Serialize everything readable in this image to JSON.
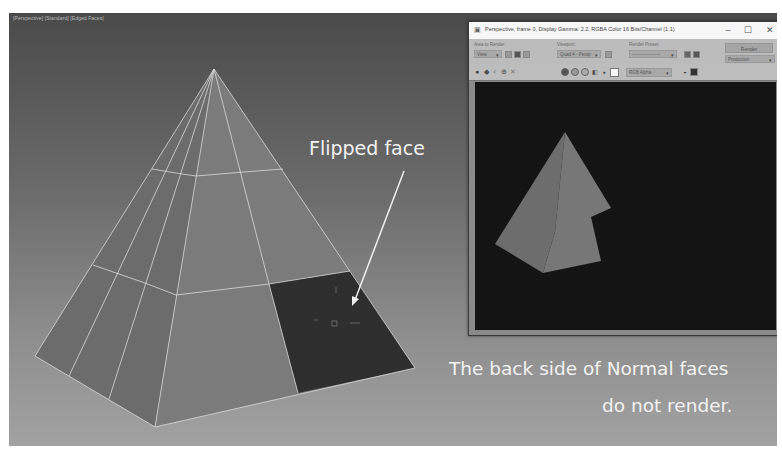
{
  "viewport": {
    "label": "[Perspective] [Standard] [Edged Faces]",
    "background_top": "#4a4a4a",
    "background_bottom": "#a2a2a2"
  },
  "scene": {
    "pyramid_face_color": "#7a7a7a",
    "pyramid_face_light": "#8a8a8a",
    "pyramid_face_dark": "#6c6c6c",
    "flipped_face_color": "#303030",
    "edge_color": "#d8d8d8"
  },
  "annotations": {
    "flipped_face": "Flipped face",
    "back_side_line1": "The back side of Normal faces",
    "back_side_line2": "do not render."
  },
  "frame_buffer": {
    "title": "Perspective, frame 0, Display Gamma: 2.2, RGBA Color 16 Bits/Channel (1:1)",
    "window_buttons": {
      "minimize": "–",
      "maximize": "☐",
      "close": "✕"
    },
    "area_to_render_label": "Area to Render:",
    "area_to_render_value": "View",
    "viewport_label": "Viewport:",
    "viewport_value": "Quad 4 - Persp",
    "render_preset_label": "Render Preset:",
    "render_preset_value": "-------------------",
    "render_button": "Render",
    "production_value": "Production",
    "channel_value": "RGB Alpha",
    "icons": [
      "save-icon",
      "copy-icon",
      "clone-icon",
      "print-icon",
      "clear-icon"
    ],
    "channel_circles": [
      "red-channel",
      "green-channel",
      "blue-channel"
    ],
    "canvas_background": "#141414"
  }
}
